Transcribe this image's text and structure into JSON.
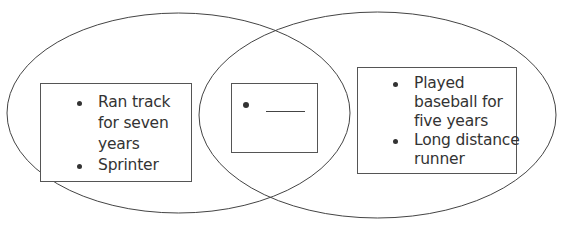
{
  "diagram": {
    "type": "venn",
    "colors": {
      "stroke": "#444444",
      "text": "#333333",
      "background": "#ffffff"
    },
    "left_set": {
      "items": [
        {
          "lines": [
            "Ran track",
            "for seven",
            "years"
          ]
        },
        {
          "lines": [
            "Sprinter"
          ]
        }
      ]
    },
    "intersection": {
      "items": [
        {
          "blank": "____"
        }
      ]
    },
    "right_set": {
      "items": [
        {
          "lines": [
            "Played",
            "baseball for",
            "five years"
          ]
        },
        {
          "lines": [
            "Long distance",
            "runner"
          ]
        }
      ]
    }
  }
}
